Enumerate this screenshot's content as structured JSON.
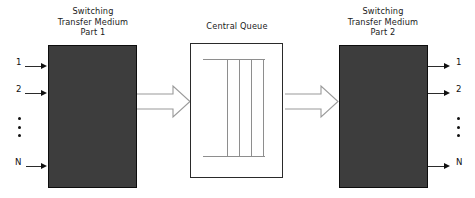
{
  "diagram": {
    "background_color": "#ffffff",
    "block_fill_color": "#3d3d3d",
    "block_border_color": "#0d0d0d",
    "queue_border_color": "#2a2a2a",
    "queue_line_color": "#8e8e8e",
    "arrow_color": "#111111"
  },
  "blocks": {
    "left": {
      "title_line1": "Switching",
      "title_line2": "Transfer Medium",
      "title_line3": "Part 1"
    },
    "queue": {
      "title": "Central Queue",
      "lane_count": 4
    },
    "right": {
      "title_line1": "Switching",
      "title_line2": "Transfer Medium",
      "title_line3": "Part 2"
    }
  },
  "ports": {
    "input": [
      {
        "label": "1"
      },
      {
        "label": "2"
      },
      {
        "label": "N"
      }
    ],
    "output": [
      {
        "label": "1"
      },
      {
        "label": "2"
      },
      {
        "label": "N"
      }
    ],
    "input_ellipsis": "vertical-ellipsis",
    "output_ellipsis": "vertical-ellipsis"
  },
  "connectors": {
    "left_to_queue": "block-arrow-right",
    "queue_to_right": "block-arrow-right"
  }
}
